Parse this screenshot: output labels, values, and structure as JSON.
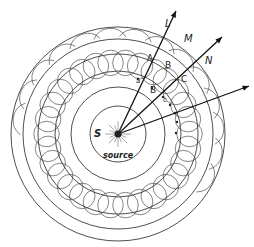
{
  "diagram": {
    "source": {
      "label": "source",
      "symbol": "S",
      "cx": 118,
      "cy": 134
    },
    "wavefronts_radii": [
      28,
      47,
      63,
      80,
      95,
      107
    ],
    "wavelet_band": {
      "inner_r": 63,
      "outer_r": 80,
      "count": 30
    },
    "rays": [
      {
        "label": "L",
        "x2": 176,
        "y2": 11
      },
      {
        "label": "N",
        "x2": 222,
        "y2": 37
      },
      {
        "label": "",
        "x2": 249,
        "y2": 86
      }
    ],
    "labels": {
      "L": "L",
      "M": "M",
      "N": "N",
      "A": "A",
      "B_upper": "B",
      "C": "C",
      "a": "a",
      "B_lower": "B",
      "c": "c",
      "S": "S",
      "source": "source"
    },
    "stroke_color": "#222222"
  }
}
